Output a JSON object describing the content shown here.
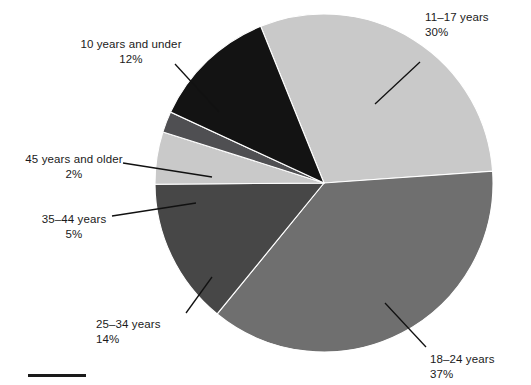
{
  "chart_data": {
    "type": "pie",
    "title": "",
    "subtitle": "",
    "xlabel": "",
    "ylabel": "",
    "legend_position": "callout-labels",
    "grid": false,
    "categories": [
      "11–17 years",
      "18–24 years",
      "25–34 years",
      "35–44 years",
      "45 years and older",
      "10 years and under"
    ],
    "values": [
      30,
      37,
      14,
      5,
      2,
      12
    ],
    "value_labels": [
      "30%",
      "37%",
      "14%",
      "5%",
      "2%",
      "12%"
    ],
    "units": "percent",
    "total": 100,
    "start_angle_deg": -22,
    "direction": "clockwise",
    "slices": [
      {
        "id": "slice-11-17",
        "label": "11–17 years",
        "value": 30,
        "value_label": "30%",
        "color": "#c9c9c9",
        "start_deg": -22,
        "end_deg": 86
      },
      {
        "id": "slice-18-24",
        "label": "18–24 years",
        "value": 37,
        "value_label": "37%",
        "color": "#6f6f6f",
        "start_deg": 86,
        "end_deg": 219.2
      },
      {
        "id": "slice-25-34",
        "label": "25–34 years",
        "value": 14,
        "value_label": "14%",
        "color": "#474747",
        "start_deg": 219.2,
        "end_deg": 269.6
      },
      {
        "id": "slice-35-44",
        "label": "35–44 years",
        "value": 5,
        "value_label": "5%",
        "color": "#c9c9c9",
        "start_deg": 269.6,
        "end_deg": 287.6
      },
      {
        "id": "slice-45-plus",
        "label": "45 years and older",
        "value": 2,
        "value_label": "2%",
        "color": "#4f4f52",
        "start_deg": 287.6,
        "end_deg": 294.8
      },
      {
        "id": "slice-10-under",
        "label": "10 years and under",
        "value": 12,
        "value_label": "12%",
        "color": "#131313",
        "start_deg": 294.8,
        "end_deg": 338
      }
    ],
    "geometry": {
      "center_x": 324,
      "center_y": 183,
      "radius": 169
    },
    "colors": {
      "light_gray": "#c9c9c9",
      "medium_gray": "#6f6f6f",
      "dark_gray": "#474747",
      "charcoal": "#4f4f52",
      "black": "#131313",
      "background": "#ffffff",
      "text": "#1a1a1a",
      "leader_line": "#111111"
    }
  },
  "labels": {
    "age_11_17": {
      "name": "11–17 years",
      "percent": "30%"
    },
    "age_18_24": {
      "name": "18–24 years",
      "percent": "37%"
    },
    "age_25_34": {
      "name": "25–34 years",
      "percent": "14%"
    },
    "age_35_44": {
      "name": "35–44 years",
      "percent": "5%"
    },
    "age_45_plus": {
      "name": "45 years and older",
      "percent": "2%"
    },
    "age_10_under": {
      "name": "10 years and under",
      "percent": "12%"
    }
  },
  "caption": {
    "text": ""
  }
}
